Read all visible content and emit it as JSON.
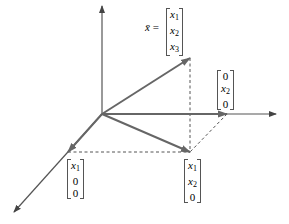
{
  "diagram": {
    "type": "3d-vector-projection",
    "colors": {
      "axis": "#555555",
      "vector": "#666666",
      "dashed": "#555555",
      "text": "#222222"
    },
    "vector_label": {
      "name": "x̄",
      "equals": "="
    },
    "labels": {
      "full_vector": {
        "entries": [
          {
            "var": "x",
            "sub": "1"
          },
          {
            "var": "x",
            "sub": "2"
          },
          {
            "var": "x",
            "sub": "3"
          }
        ]
      },
      "x2_component": {
        "entries": [
          {
            "num": "0"
          },
          {
            "var": "x",
            "sub": "2"
          },
          {
            "num": "0"
          }
        ]
      },
      "x1_component": {
        "entries": [
          {
            "var": "x",
            "sub": "1"
          },
          {
            "num": "0"
          },
          {
            "num": "0"
          }
        ]
      },
      "xy_projection": {
        "entries": [
          {
            "var": "x",
            "sub": "1"
          },
          {
            "var": "x",
            "sub": "2"
          },
          {
            "num": "0"
          }
        ]
      }
    }
  }
}
